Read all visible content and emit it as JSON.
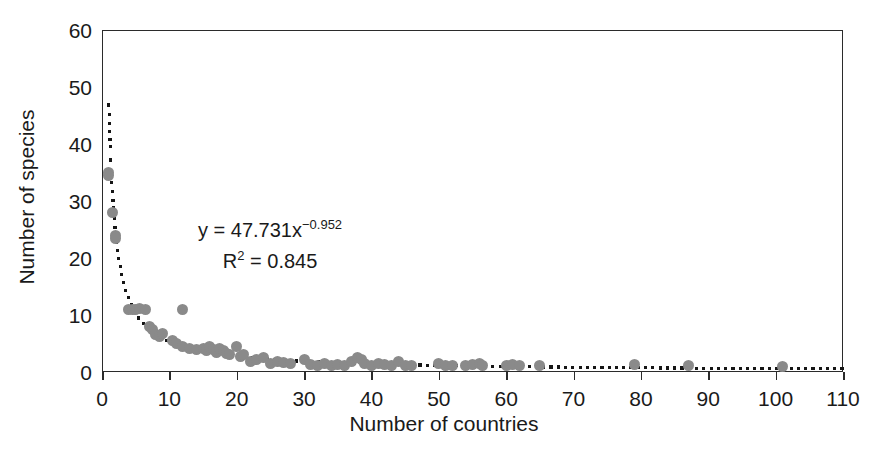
{
  "chart_data": {
    "type": "scatter",
    "title": "",
    "xlabel": "Number of countries",
    "ylabel": "Number of species",
    "xlim": [
      0,
      110
    ],
    "ylim": [
      0,
      60
    ],
    "xticks": [
      0,
      10,
      20,
      30,
      40,
      50,
      60,
      70,
      80,
      90,
      100,
      110
    ],
    "yticks": [
      0,
      10,
      20,
      30,
      40,
      50,
      60
    ],
    "grid": false,
    "legend": null,
    "marker_color": "#8a8a8a",
    "trendline_color": "#151515",
    "frame_color": "#2b2b2b",
    "annotations": [
      {
        "text": "y = 47.731x",
        "exponent": "−0.952"
      },
      {
        "text": "R",
        "sup": "2",
        "rest": " = 0.845"
      }
    ],
    "equation_line1": "y = 47.731x",
    "equation_exponent": "−0.952",
    "equation_r2_base": "R",
    "equation_r2_sup": "2",
    "equation_r2_rest": " = 0.845",
    "fit": {
      "model": "power",
      "coefficient": 47.731,
      "exponent": -0.952,
      "r_squared": 0.845
    },
    "points": [
      [
        1,
        35
      ],
      [
        1,
        34.5
      ],
      [
        1.5,
        28
      ],
      [
        2,
        24
      ],
      [
        2,
        23.5
      ],
      [
        4,
        11
      ],
      [
        4.5,
        11
      ],
      [
        5,
        11
      ],
      [
        5.5,
        11.2
      ],
      [
        6.5,
        11
      ],
      [
        7,
        8
      ],
      [
        7.5,
        7.5
      ],
      [
        8,
        6.5
      ],
      [
        8.5,
        6.3
      ],
      [
        9,
        6.8
      ],
      [
        12,
        11
      ],
      [
        10.5,
        5.5
      ],
      [
        11,
        5
      ],
      [
        12,
        4.5
      ],
      [
        13,
        4.2
      ],
      [
        14,
        4
      ],
      [
        15,
        4.2
      ],
      [
        15.5,
        3.8
      ],
      [
        16,
        4.5
      ],
      [
        16.5,
        4
      ],
      [
        17,
        3.5
      ],
      [
        17.5,
        4.2
      ],
      [
        18,
        3.8
      ],
      [
        18.5,
        3.2
      ],
      [
        19,
        3
      ],
      [
        20,
        4.5
      ],
      [
        20.5,
        2.8
      ],
      [
        21,
        3
      ],
      [
        22,
        1.8
      ],
      [
        23,
        2.2
      ],
      [
        24,
        2.5
      ],
      [
        25,
        1.5
      ],
      [
        26,
        1.8
      ],
      [
        27,
        1.6
      ],
      [
        28,
        1.5
      ],
      [
        30,
        2.2
      ],
      [
        31,
        1.4
      ],
      [
        32,
        1.2
      ],
      [
        33,
        1.5
      ],
      [
        34,
        1.2
      ],
      [
        35,
        1.4
      ],
      [
        36,
        1.2
      ],
      [
        37,
        1.8
      ],
      [
        38,
        2.5
      ],
      [
        38.5,
        2.2
      ],
      [
        39,
        1.5
      ],
      [
        40,
        1.2
      ],
      [
        41,
        1.5
      ],
      [
        42,
        1.3
      ],
      [
        43,
        1.2
      ],
      [
        44,
        1.8
      ],
      [
        45,
        1.2
      ],
      [
        46,
        1.1
      ],
      [
        50,
        1.5
      ],
      [
        51,
        1.2
      ],
      [
        52,
        1.1
      ],
      [
        54,
        1.2
      ],
      [
        55,
        1.3
      ],
      [
        56,
        1.5
      ],
      [
        56.5,
        1.1
      ],
      [
        60,
        1.2
      ],
      [
        61,
        1.4
      ],
      [
        62,
        1.2
      ],
      [
        65,
        1.2
      ],
      [
        79,
        1.3
      ],
      [
        87,
        1.2
      ],
      [
        101,
        1.0
      ]
    ]
  }
}
